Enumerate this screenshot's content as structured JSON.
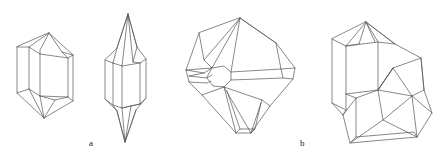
{
  "figure": {
    "kind": "crystal-habit-line-drawings",
    "background_color": "#ffffff",
    "stroke_color": "#55555a",
    "stroke_width": 0.7,
    "width": 436,
    "height": 162,
    "labels": [
      {
        "id": "a",
        "text": "a",
        "x": 89,
        "y": 139
      },
      {
        "id": "b",
        "text": "b",
        "x": 300,
        "y": 139
      }
    ],
    "crystals": [
      {
        "id": "crystal-1",
        "group": "a",
        "description": "hexagonal prism with pyramidal terminations",
        "paths": [
          "M 17 47 L 17 93 L 44 118 L 73 101 L 73 55 L 49 33 Z",
          "M 17 47 L 29 47 L 29 89 L 17 93",
          "M 29 47 L 49 33",
          "M 29 89 L 44 118",
          "M 29 47 L 40 54 L 40 50 L 49 33",
          "M 40 54 L 40 96 L 29 89",
          "M 40 96 L 44 118",
          "M 40 54 L 68 58 L 73 55",
          "M 68 58 L 68 97 L 40 96",
          "M 68 97 L 73 101",
          "M 49 33 L 62 52 L 68 58",
          "M 62 52 L 73 55",
          "M 44 118 L 55 100 L 68 97",
          "M 55 100 L 40 96"
        ]
      },
      {
        "id": "crystal-2",
        "group": "a",
        "description": "elongated bipyramidal prism, near-vertical orientation",
        "paths": [
          "M 105 60 L 105 99 L 117 111 L 125 142 L 136 110 L 146 98 L 146 59 L 137 47 L 128 14 L 117 48 Z",
          "M 105 60 L 113 63 L 113 105 L 105 99",
          "M 113 63 L 117 48",
          "M 113 105 L 117 111",
          "M 113 63 L 122 66 L 122 108 L 113 105",
          "M 122 66 L 128 14",
          "M 122 108 L 125 142",
          "M 122 66 L 140 63 L 146 59",
          "M 140 63 L 140 104 L 122 108",
          "M 140 104 L 146 98",
          "M 128 14 L 133 62 L 140 63",
          "M 133 62 L 137 47",
          "M 125 142 L 131 106 L 140 104",
          "M 131 106 L 122 108",
          "M 128 14 L 117 48",
          "M 128 14 L 137 47",
          "M 125 142 L 117 111",
          "M 125 142 L 136 110"
        ]
      },
      {
        "id": "crystal-3",
        "group": "b",
        "description": "complex multi-faceted crystal with central polygonal facet and spreading pyramid faces",
        "paths": [
          "M 199 33 L 186 70 L 189 82 L 202 95 L 236 133 L 251 133 L 270 106 L 293 79 L 295 68 L 276 43 L 240 18 Z",
          "M 199 33 L 204 60 L 212 68 L 186 70",
          "M 204 60 L 240 18",
          "M 212 68 L 240 18",
          "M 186 70 L 204 73 L 212 68",
          "M 204 73 L 189 76",
          "M 189 76 L 207 78 L 212 75",
          "M 189 82 L 207 83 L 211 81",
          "M 212 68 L 224 66 L 231 72 L 231 80 L 224 87 L 213 86 L 207 78 Z",
          "M 240 18 L 231 72",
          "M 231 72 L 281 69 L 295 68",
          "M 231 80 L 283 78 L 293 79",
          "M 281 69 L 283 78",
          "M 240 18 L 276 43",
          "M 276 43 L 281 69",
          "M 224 87 L 202 95",
          "M 224 87 L 236 133",
          "M 224 87 L 251 133",
          "M 224 87 L 262 100 L 270 106",
          "M 262 100 L 251 133",
          "M 236 133 L 240 129 L 255 129 L 251 133",
          "M 240 129 L 227 91",
          "M 255 129 L 261 103"
        ]
      },
      {
        "id": "crystal-4",
        "group": "b",
        "description": "twinned pair of two blocky terminated crystals joined at an angle",
        "paths": [
          "M 332 39 L 332 103 L 343 115 L 350 143 L 417 137 L 432 113 L 424 90 L 421 58 L 395 44 L 366 22 Z",
          "M 332 39 L 346 46 L 346 110 L 332 103",
          "M 346 46 L 366 22",
          "M 346 110 L 343 115",
          "M 346 46 L 378 42 L 395 44",
          "M 378 42 L 378 90",
          "M 366 22 L 375 42",
          "M 366 22 L 395 44",
          "M 366 22 L 359 44",
          "M 359 44 L 346 46",
          "M 378 90 L 346 94",
          "M 378 42 L 366 22",
          "M 343 115 L 356 98 L 378 90",
          "M 356 98 L 346 94",
          "M 378 90 L 393 68 L 421 58",
          "M 393 68 L 378 90",
          "M 421 58 L 424 90",
          "M 393 68 L 412 96 L 424 90",
          "M 393 68 L 378 90 L 412 96",
          "M 412 96 L 432 113",
          "M 412 96 L 417 137",
          "M 378 90 L 383 120 L 417 137",
          "M 383 120 L 350 143",
          "M 383 120 L 412 96",
          "M 350 143 L 356 137 L 414 132 L 417 137",
          "M 356 137 L 356 98"
        ]
      }
    ]
  }
}
